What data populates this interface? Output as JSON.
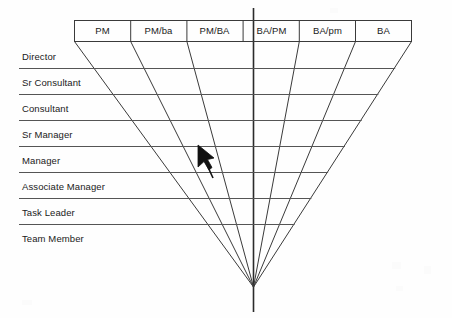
{
  "diagram": {
    "type": "funnel-role-matrix",
    "colors": {
      "line": "#333333",
      "text": "#1a1a1a",
      "background": "#fefefe",
      "cursor": "#000000"
    },
    "columns": [
      {
        "id": "pm",
        "label": "PM"
      },
      {
        "id": "pm_ba_lower",
        "label": "PM/ba"
      },
      {
        "id": "pm_ba",
        "label": "PM/BA"
      },
      {
        "id": "ba_pm",
        "label": "BA/PM"
      },
      {
        "id": "ba_pm_lower",
        "label": "BA/pm"
      },
      {
        "id": "ba",
        "label": "BA"
      }
    ],
    "rows": [
      {
        "id": "director",
        "label": "Director"
      },
      {
        "id": "sr-consultant",
        "label": "Sr Consultant"
      },
      {
        "id": "consultant",
        "label": "Consultant"
      },
      {
        "id": "sr-manager",
        "label": "Sr Manager"
      },
      {
        "id": "manager",
        "label": "Manager"
      },
      {
        "id": "associate-manager",
        "label": "Associate Manager"
      },
      {
        "id": "task-leader",
        "label": "Task Leader"
      },
      {
        "id": "team-member",
        "label": "Team Member"
      }
    ],
    "cursor": {
      "name": "mouse-pointer",
      "x": 197,
      "y": 148
    }
  }
}
